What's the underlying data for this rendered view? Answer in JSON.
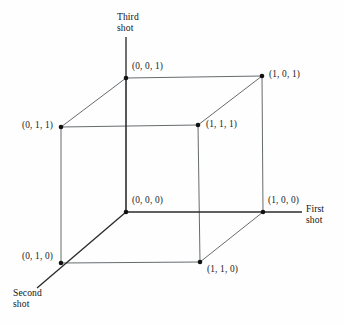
{
  "figure": {
    "background_color": "#fefefe",
    "edge_color": "#555a5e",
    "axis_color": "#2b2b2b",
    "vertex_color": "#111111",
    "text_color": "#1a1a1a"
  },
  "axes": [
    {
      "id": "first-shot",
      "label_line1": "First",
      "label_line2": "shot",
      "direction": "right"
    },
    {
      "id": "second-shot",
      "label_line1": "Second",
      "label_line2": "shot",
      "direction": "down-left"
    },
    {
      "id": "third-shot",
      "label_line1": "Third",
      "label_line2": "shot",
      "direction": "up"
    }
  ],
  "vertices": [
    {
      "id": "v001",
      "label": "(0, 0, 1)",
      "coords": [
        0,
        0,
        1
      ],
      "x": 126,
      "y": 78
    },
    {
      "id": "v101",
      "label": "(1, 0, 1)",
      "coords": [
        1,
        0,
        1
      ],
      "x": 262,
      "y": 76
    },
    {
      "id": "v011",
      "label": "(0, 1, 1)",
      "coords": [
        0,
        1,
        1
      ],
      "x": 61,
      "y": 127
    },
    {
      "id": "v111",
      "label": "(1, 1, 1)",
      "coords": [
        1,
        1,
        1
      ],
      "x": 198,
      "y": 125
    },
    {
      "id": "v000",
      "label": "(0, 0, 0)",
      "coords": [
        0,
        0,
        0
      ],
      "x": 126,
      "y": 212
    },
    {
      "id": "v100",
      "label": "(1, 0, 0)",
      "coords": [
        1,
        0,
        0
      ],
      "x": 263,
      "y": 212
    },
    {
      "id": "v010",
      "label": "(0, 1, 0)",
      "coords": [
        0,
        1,
        0
      ],
      "x": 61,
      "y": 263
    },
    {
      "id": "v110",
      "label": "(1, 1, 0)",
      "coords": [
        1,
        1,
        0
      ],
      "x": 200,
      "y": 262
    }
  ],
  "edges": [
    {
      "from": "v001",
      "to": "v101"
    },
    {
      "from": "v001",
      "to": "v011"
    },
    {
      "from": "v001",
      "to": "v000"
    },
    {
      "from": "v101",
      "to": "v111"
    },
    {
      "from": "v101",
      "to": "v100"
    },
    {
      "from": "v011",
      "to": "v111"
    },
    {
      "from": "v011",
      "to": "v010"
    },
    {
      "from": "v111",
      "to": "v110"
    },
    {
      "from": "v000",
      "to": "v100"
    },
    {
      "from": "v000",
      "to": "v010"
    },
    {
      "from": "v100",
      "to": "v110"
    },
    {
      "from": "v010",
      "to": "v110"
    }
  ]
}
